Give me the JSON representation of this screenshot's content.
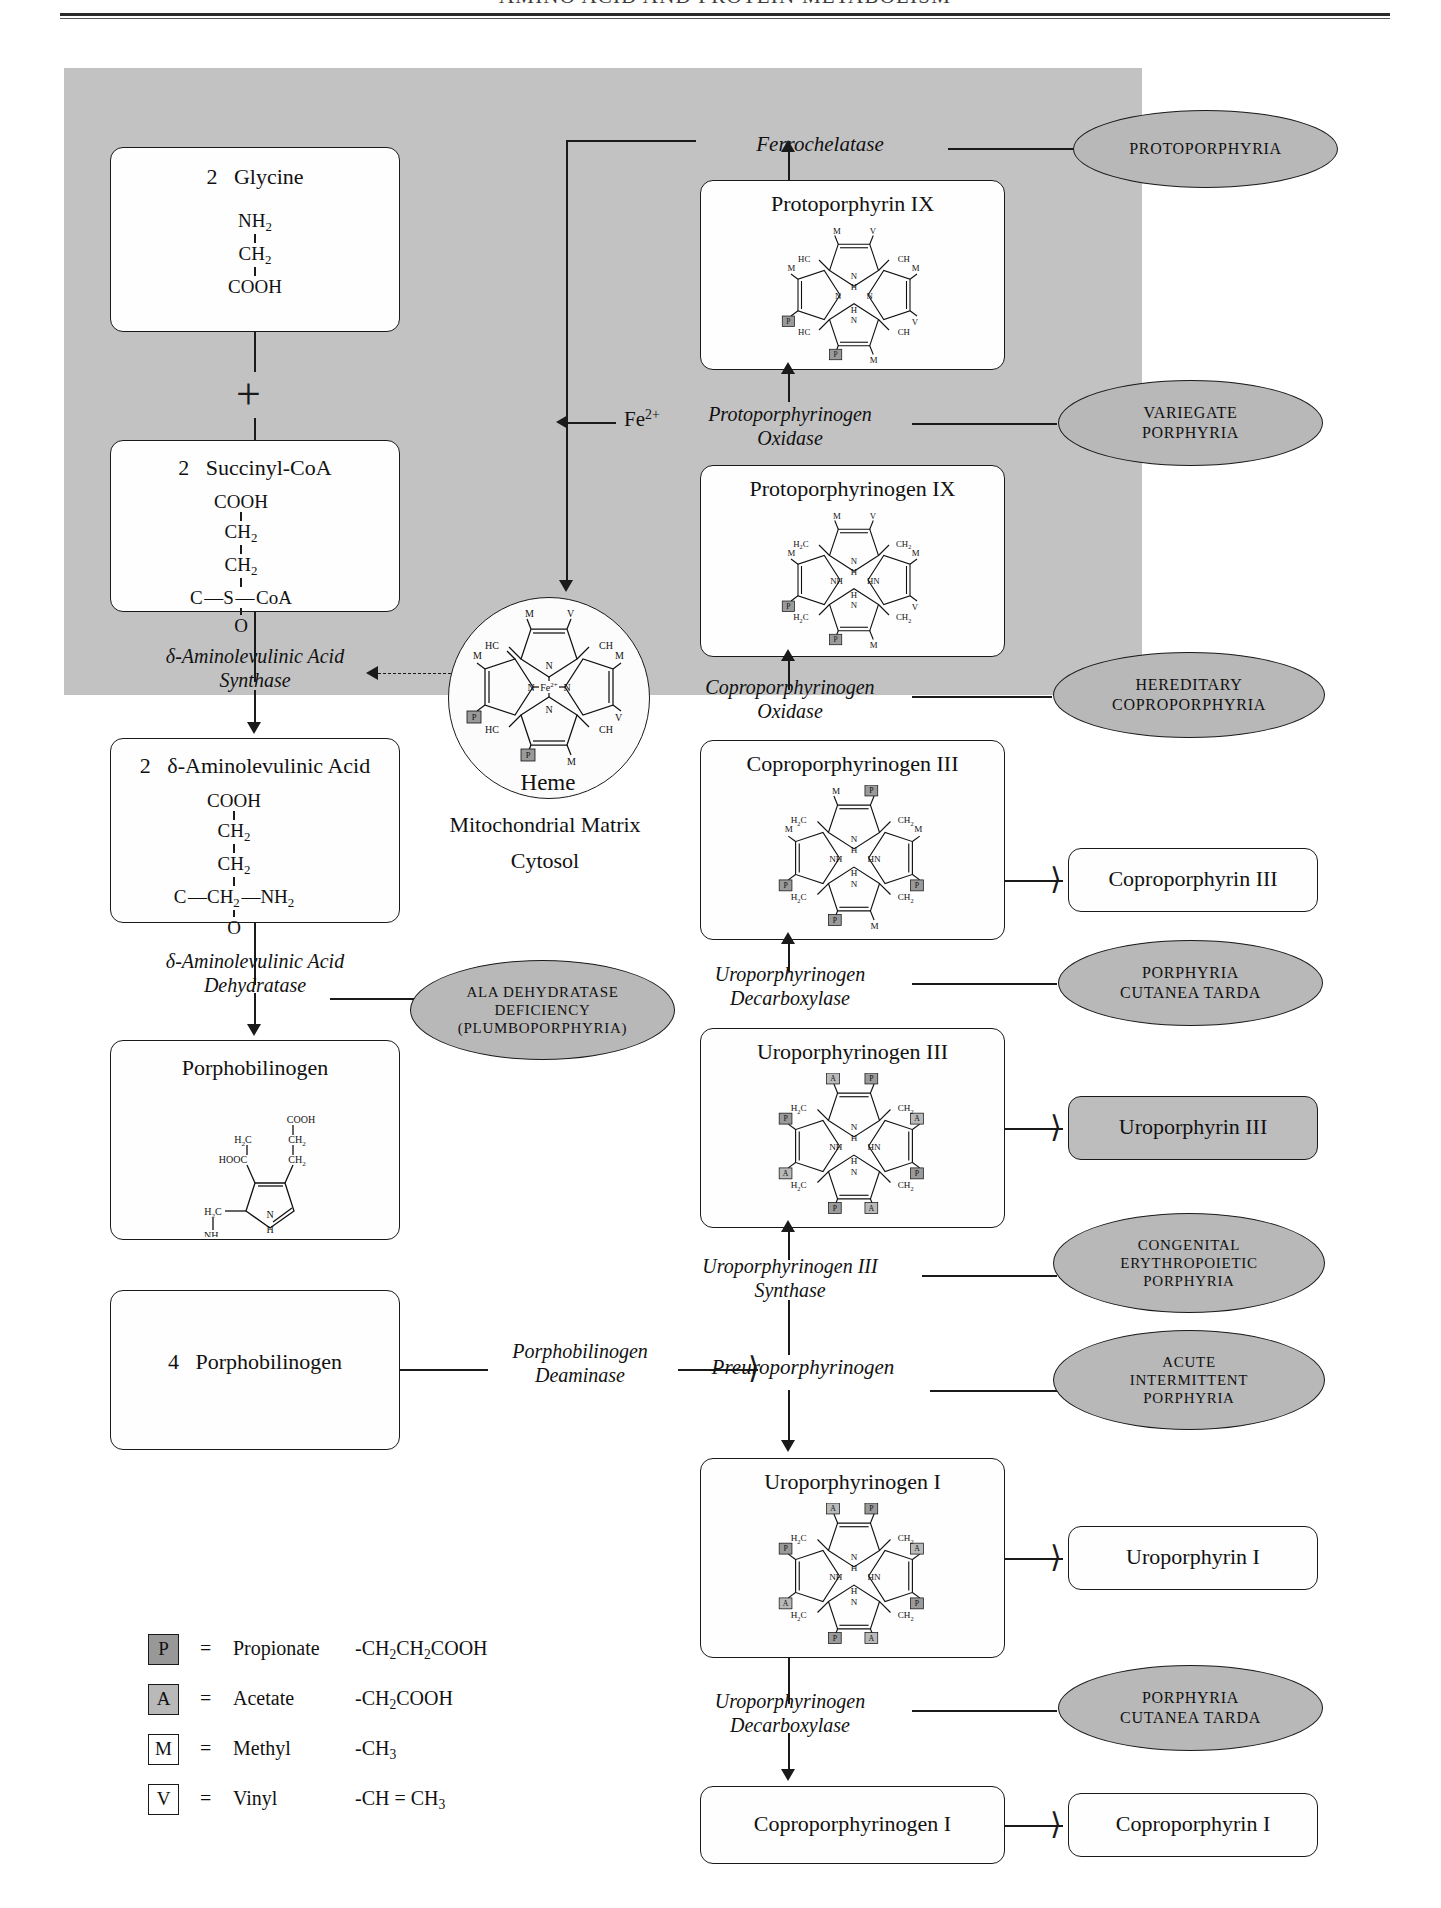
{
  "header": {
    "title": "AMINO ACID AND PROTEIN METABOLISM"
  },
  "regions": {
    "mitochondrial_matrix": "Mitochondrial Matrix",
    "cytosol": "Cytosol"
  },
  "substrates": {
    "glycine": {
      "count": "2",
      "name": "Glycine",
      "formula": [
        "NH2",
        "CH2",
        "COOH"
      ]
    },
    "succinyl_coa": {
      "count": "2",
      "name": "Succinyl-CoA",
      "formula": [
        "COOH",
        "CH2",
        "CH2",
        "C—S—CoA",
        "O"
      ]
    },
    "ala": {
      "count": "2",
      "name": "δ-Aminolevulinic Acid",
      "formula": [
        "COOH",
        "CH2",
        "CH2",
        "C—CH2—NH2",
        "O"
      ]
    },
    "porphobilinogen": {
      "name": "Porphobilinogen"
    },
    "porphobilinogen4": {
      "count": "4",
      "name": "Porphobilinogen"
    },
    "heme": {
      "name": "Heme",
      "metal": "Fe2+"
    },
    "fe_input": "Fe2+",
    "plus": "+"
  },
  "intermediates": [
    {
      "id": "protoporphyrin-ix",
      "label": "Protoporphyrin IX"
    },
    {
      "id": "protoporphyrinogen-ix",
      "label": "Protoporphyrinogen IX"
    },
    {
      "id": "coproporphyrinogen-iii",
      "label": "Coproporphyrinogen III"
    },
    {
      "id": "uroporphyrinogen-iii",
      "label": "Uroporphyrinogen III"
    },
    {
      "id": "preuroporphyrinogen",
      "label": "Preuroporphyrinogen"
    },
    {
      "id": "uroporphyrinogen-i",
      "label": "Uroporphyrinogen I"
    },
    {
      "id": "coproporphyrinogen-i",
      "label": "Coproporphyrinogen I"
    }
  ],
  "products": [
    {
      "id": "coproporphyrin-iii",
      "label": "Coproporphyrin III",
      "filled": false
    },
    {
      "id": "uroporphyrin-iii",
      "label": "Uroporphyrin III",
      "filled": true
    },
    {
      "id": "uroporphyrin-i",
      "label": "Uroporphyrin I",
      "filled": false
    },
    {
      "id": "coproporphyrin-i",
      "label": "Coproporphyrin I",
      "filled": false
    }
  ],
  "enzymes": [
    {
      "id": "ferrochelatase",
      "label": "Ferrochelatase"
    },
    {
      "id": "protoporphyrinogen-oxidase",
      "line1": "Protoporphyrinogen",
      "line2": "Oxidase"
    },
    {
      "id": "coproporphyrinogen-oxidase",
      "line1": "Coproporphyrinogen",
      "line2": "Oxidase"
    },
    {
      "id": "ala-synthase",
      "line1": "δ-Aminolevulinic Acid",
      "line2": "Synthase"
    },
    {
      "id": "ala-dehydratase",
      "line1": "δ-Aminolevulinic Acid",
      "line2": "Dehydratase"
    },
    {
      "id": "uroporphyrinogen-decarboxylase-iii",
      "line1": "Uroporphyrinogen",
      "line2": "Decarboxylase"
    },
    {
      "id": "uroporphyrinogen-iii-synthase",
      "line1": "Uroporphyrinogen III",
      "line2": "Synthase"
    },
    {
      "id": "porphobilinogen-deaminase",
      "line1": "Porphobilinogen",
      "line2": "Deaminase"
    },
    {
      "id": "uroporphyrinogen-decarboxylase-i",
      "line1": "Uroporphyrinogen",
      "line2": "Decarboxylase"
    }
  ],
  "diseases": [
    {
      "id": "protoporphyria",
      "lines": [
        "PROTOPORPHYRIA"
      ]
    },
    {
      "id": "variegate-porphyria",
      "lines": [
        "VARIEGATE",
        "PORPHYRIA"
      ]
    },
    {
      "id": "hereditary-coproporphyria",
      "lines": [
        "HEREDITARY",
        "COPROPORPHYRIA"
      ]
    },
    {
      "id": "porphyria-cutanea-tarda-1",
      "lines": [
        "PORPHYRIA",
        "CUTANEA TARDA"
      ]
    },
    {
      "id": "ala-dehydratase-deficiency",
      "lines": [
        "ALA DEHYDRATASE",
        "DEFICIENCY",
        "(PLUMBOPORPHYRIA)"
      ]
    },
    {
      "id": "congenital-erythropoietic-porphyria",
      "lines": [
        "CONGENITAL",
        "ERYTHROPOIETIC",
        "PORPHYRIA"
      ]
    },
    {
      "id": "acute-intermittent-porphyria",
      "lines": [
        "ACUTE",
        "INTERMITTENT",
        "PORPHYRIA"
      ]
    },
    {
      "id": "porphyria-cutanea-tarda-2",
      "lines": [
        "PORPHYRIA",
        "CUTANEA TARDA"
      ]
    }
  ],
  "legend": {
    "items": [
      {
        "symbol": "P",
        "equals": "=",
        "name": "Propionate",
        "formula": "-CH2CH2COOH",
        "fill": "dark"
      },
      {
        "symbol": "A",
        "equals": "=",
        "name": "Acetate",
        "formula": "-CH2COOH",
        "fill": "mid"
      },
      {
        "symbol": "M",
        "equals": "=",
        "name": "Methyl",
        "formula": "-CH3",
        "fill": "none"
      },
      {
        "symbol": "V",
        "equals": "=",
        "name": "Vinyl",
        "formula": "-CH = CH3",
        "fill": "none"
      }
    ]
  },
  "colors": {
    "mitochondria_fill": "#c2c2c2",
    "disease_fill": "#b8b8b8",
    "product_fill": "#bdbdbd",
    "stroke": "#1a1a1a"
  }
}
